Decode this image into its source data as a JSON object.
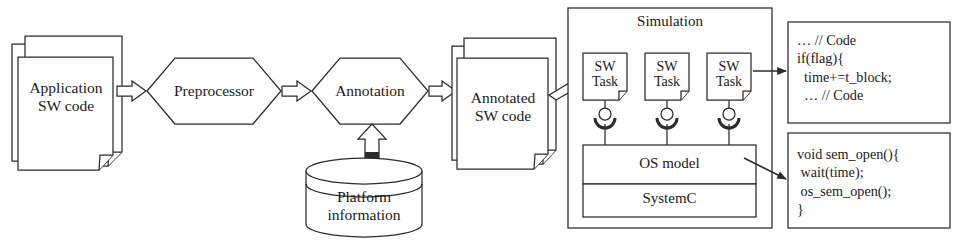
{
  "diagram": {
    "stroke_color": "#2b2b2b",
    "fill_color": "#ffffff"
  },
  "nodes": {
    "application_sw_code": {
      "label": "Application\nSW code",
      "shape": "document-stack"
    },
    "preprocessor": {
      "label": "Preprocessor",
      "shape": "hexagon"
    },
    "annotation": {
      "label": "Annotation",
      "shape": "hexagon"
    },
    "platform_information": {
      "label": "Platform\ninformation",
      "shape": "cylinder"
    },
    "annotated_sw_code": {
      "label": "Annotated\nSW code",
      "shape": "document-stack"
    }
  },
  "simulation": {
    "title": "Simulation",
    "tasks": [
      {
        "label": "SW\nTask"
      },
      {
        "label": "SW\nTask"
      },
      {
        "label": "SW\nTask"
      }
    ],
    "os_model": {
      "label": "OS model"
    },
    "systemc": {
      "label": "SystemC"
    },
    "connector_icon": "ball-and-socket-icon"
  },
  "code_snippets": {
    "task_code": {
      "lines": [
        "… // Code",
        "if(flag){",
        "  time+=t_block;",
        "  … // Code"
      ],
      "text": "… // Code\nif(flag){\n  time+=t_block;\n  … // Code"
    },
    "os_code": {
      "lines": [
        "void sem_open(){",
        " wait(time);",
        " os_sem_open();",
        "}"
      ],
      "text": "void sem_open(){\n wait(time);\n os_sem_open();\n}"
    }
  },
  "arrows": [
    {
      "name": "app-to-preprocessor",
      "style": "block"
    },
    {
      "name": "preprocessor-to-annotation",
      "style": "block"
    },
    {
      "name": "annotation-to-annotated",
      "style": "block"
    },
    {
      "name": "platform-to-annotation",
      "style": "block-up"
    },
    {
      "name": "annotated-to-simulation",
      "style": "block"
    },
    {
      "name": "task-to-task-code",
      "style": "line"
    },
    {
      "name": "osmodel-to-os-code",
      "style": "line"
    }
  ]
}
